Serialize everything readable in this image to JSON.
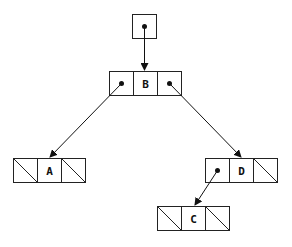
{
  "diagram": {
    "type": "binary-tree-linked-structure",
    "root_pointer": {
      "x": 132,
      "y": 14,
      "w": 25,
      "h": 24
    },
    "nodes": [
      {
        "id": "B",
        "label": "B",
        "x": 109,
        "y": 71,
        "left": "pointer",
        "right": "pointer"
      },
      {
        "id": "A",
        "label": "A",
        "x": 13,
        "y": 158,
        "left": "null",
        "right": "null"
      },
      {
        "id": "D",
        "label": "D",
        "x": 205,
        "y": 158,
        "left": "pointer",
        "right": "null"
      },
      {
        "id": "C",
        "label": "C",
        "x": 157,
        "y": 206,
        "left": "null",
        "right": "null"
      }
    ],
    "edges": [
      {
        "from": "root",
        "to": "B"
      },
      {
        "from": "B",
        "side": "left",
        "to": "A"
      },
      {
        "from": "B",
        "side": "right",
        "to": "D"
      },
      {
        "from": "D",
        "side": "left",
        "to": "C"
      }
    ],
    "labels": {
      "B": "B",
      "A": "A",
      "D": "D",
      "C": "C"
    }
  }
}
